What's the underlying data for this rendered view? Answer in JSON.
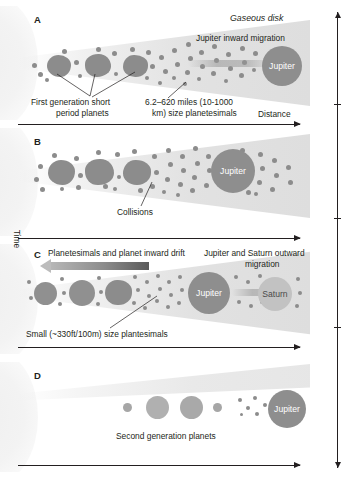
{
  "figure": {
    "axes": {
      "distance_label": "Distance",
      "time_label": "Time"
    },
    "colors": {
      "planetesimal": "#8c8c8c",
      "jupiter": "#8e8e8e",
      "saturn": "#c2c2c2",
      "disk": "#e0e0e0",
      "text": "#231f20"
    }
  },
  "panels": [
    {
      "letter": "A",
      "labels": {
        "disk": "Gaseous disk",
        "migration": "Jupiter inward migration",
        "first_gen_line1": "First generation short",
        "first_gen_line2": "period planets",
        "planetesimal_line1": "6.2–620 miles (10-1000",
        "planetesimal_line2": "km) size planetesimals"
      },
      "bodies": {
        "jupiter": "Jupiter"
      }
    },
    {
      "letter": "B",
      "labels": {
        "collisions": "Collisions"
      },
      "bodies": {
        "jupiter": "Jupiter"
      }
    },
    {
      "letter": "C",
      "labels": {
        "inward_drift": "Planetesimals and planet inward drift",
        "outward_line1": "Jupiter and Saturn outward",
        "outward_line2": "migration",
        "small_planetesimals": "Small (~330ft/100m) size plantesimals"
      },
      "bodies": {
        "jupiter": "Jupiter",
        "saturn": "Saturn"
      }
    },
    {
      "letter": "D",
      "labels": {
        "second_gen": "Second generation planets"
      },
      "bodies": {
        "jupiter": "Jupiter"
      }
    }
  ]
}
